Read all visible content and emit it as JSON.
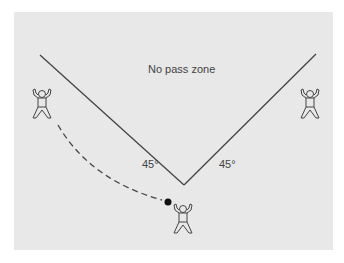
{
  "diagram": {
    "zone_label": "No pass zone",
    "angle_left": "45°",
    "angle_right": "45°",
    "colors": {
      "background": "#e8e8e8",
      "line": "#444444",
      "ball": "#111111"
    },
    "figures": [
      "left-player",
      "right-player",
      "bottom-player-with-ball"
    ]
  }
}
